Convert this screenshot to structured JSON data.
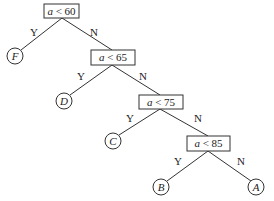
{
  "diagram": {
    "type": "decision-tree",
    "nodes": [
      {
        "id": "n1",
        "kind": "decision",
        "var": "a",
        "op": "<",
        "value": "60"
      },
      {
        "id": "n2",
        "kind": "decision",
        "var": "a",
        "op": "<",
        "value": "65"
      },
      {
        "id": "n3",
        "kind": "decision",
        "var": "a",
        "op": "<",
        "value": "75"
      },
      {
        "id": "n4",
        "kind": "decision",
        "var": "a",
        "op": "<",
        "value": "85"
      },
      {
        "id": "F",
        "kind": "leaf",
        "label": "F"
      },
      {
        "id": "D",
        "kind": "leaf",
        "label": "D"
      },
      {
        "id": "C",
        "kind": "leaf",
        "label": "C"
      },
      {
        "id": "B",
        "kind": "leaf",
        "label": "B"
      },
      {
        "id": "A",
        "kind": "leaf",
        "label": "A"
      }
    ],
    "edges": [
      {
        "from": "n1",
        "to": "F",
        "label": "Y"
      },
      {
        "from": "n1",
        "to": "n2",
        "label": "N"
      },
      {
        "from": "n2",
        "to": "D",
        "label": "Y"
      },
      {
        "from": "n2",
        "to": "n3",
        "label": "N"
      },
      {
        "from": "n3",
        "to": "C",
        "label": "Y"
      },
      {
        "from": "n3",
        "to": "n4",
        "label": "N"
      },
      {
        "from": "n4",
        "to": "B",
        "label": "Y"
      },
      {
        "from": "n4",
        "to": "A",
        "label": "N"
      }
    ]
  },
  "text": {
    "n1_var": "a",
    "n1_rest": " < 60",
    "n2_var": "a",
    "n2_rest": " < 65",
    "n3_var": "a",
    "n3_rest": " < 75",
    "n4_var": "a",
    "n4_rest": " < 85",
    "leaf_F": "F",
    "leaf_D": "D",
    "leaf_C": "C",
    "leaf_B": "B",
    "leaf_A": "A",
    "yes": "Y",
    "no": "N"
  }
}
